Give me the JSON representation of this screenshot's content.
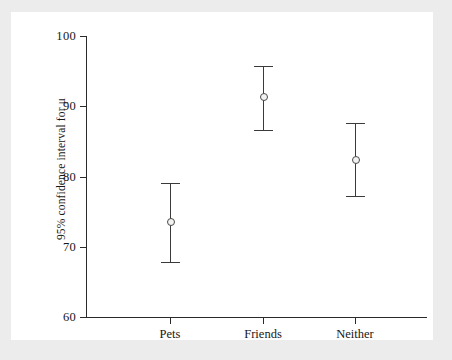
{
  "chart_data": {
    "type": "scatter",
    "title": "",
    "subtitle": "",
    "xlabel": "",
    "ylabel": "95% confidence interval for μ",
    "categories": [
      "Pets",
      "Friends",
      "Neither"
    ],
    "ylim": [
      60,
      100
    ],
    "yticks": [
      60,
      70,
      80,
      90,
      100
    ],
    "ytick_labels": [
      "60",
      "70",
      "80",
      "90",
      "100"
    ],
    "grid": false,
    "legend": "none",
    "series": [
      {
        "name": "95% confidence interval for μ",
        "marker": "open-circle",
        "errorbars": [
          {
            "category": "Pets",
            "value": 73.5,
            "lower": 67.8,
            "upper": 79.1
          },
          {
            "category": "Friends",
            "value": 91.3,
            "lower": 86.6,
            "upper": 95.8
          },
          {
            "category": "Neither",
            "value": 82.4,
            "lower": 77.2,
            "upper": 87.6
          }
        ]
      }
    ],
    "annotations": []
  },
  "figure": {
    "background_color": "#ececed",
    "panel_color": "#ffffff",
    "axis_color": "#2a2a2a",
    "marker_fill": "#f2f2f0",
    "marker_stroke": "#4a4a4a",
    "errorbar_color": "#3a3a3a"
  }
}
